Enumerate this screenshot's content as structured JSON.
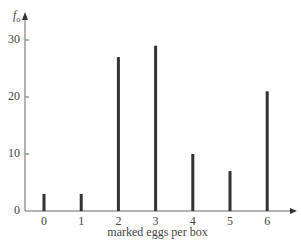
{
  "chart_data": {
    "type": "bar",
    "style": "stem",
    "title": "",
    "xlabel": "marked eggs per box",
    "ylabel": "f_o",
    "ylabel_main": "f",
    "ylabel_sub": "o",
    "categories": [
      "0",
      "1",
      "2",
      "3",
      "4",
      "5",
      "6"
    ],
    "values": [
      3,
      3,
      27,
      29,
      10,
      7,
      21
    ],
    "yticks": [
      "0",
      "10",
      "20",
      "30"
    ],
    "ylim": [
      0,
      32
    ],
    "grid": false,
    "legend": null,
    "bar_color": "#333333",
    "axis_color": "#666666"
  }
}
